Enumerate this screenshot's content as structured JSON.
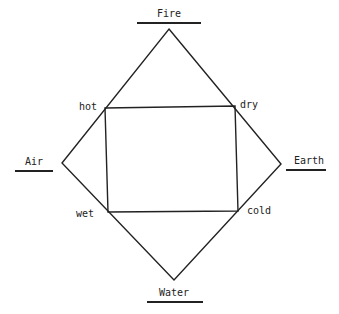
{
  "diagram": {
    "elements": {
      "top": "Fire",
      "left": "Air",
      "right": "Earth",
      "bottom": "Water"
    },
    "qualities": {
      "top_left": "hot",
      "top_right": "dry",
      "bottom_left": "wet",
      "bottom_right": "cold"
    },
    "colors": {
      "line": "#222222",
      "background": "#ffffff"
    },
    "diamond": [
      [
        169,
        29
      ],
      [
        281,
        164
      ],
      [
        174,
        280
      ],
      [
        62,
        163
      ]
    ],
    "rectangle": [
      [
        105,
        108
      ],
      [
        235,
        106
      ],
      [
        238,
        211
      ],
      [
        108,
        212
      ]
    ]
  }
}
